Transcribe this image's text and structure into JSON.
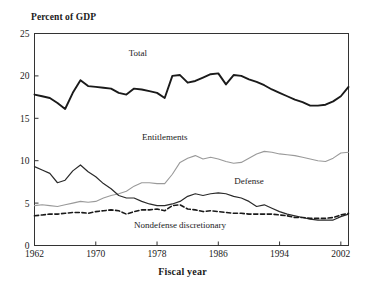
{
  "chart_data": {
    "type": "line",
    "title": "",
    "ylabel": "Percent of GDP",
    "xlabel": "Fiscal year",
    "ylim": [
      0,
      25
    ],
    "xlim": [
      1962,
      2003
    ],
    "yticks": [
      0,
      5,
      10,
      15,
      20,
      25
    ],
    "ytick_labels": [
      "0",
      "5",
      "10",
      "15",
      "20",
      "25"
    ],
    "xticks": [
      1962,
      1970,
      1978,
      1986,
      1994,
      2002
    ],
    "xtick_labels": [
      "1962",
      "1970",
      "1978",
      "1986",
      "1994",
      "2002"
    ],
    "grid": false,
    "legend_position": "inline-annotations",
    "x": [
      1962,
      1963,
      1964,
      1965,
      1966,
      1967,
      1968,
      1969,
      1970,
      1971,
      1972,
      1973,
      1974,
      1975,
      1976,
      1977,
      1978,
      1979,
      1980,
      1981,
      1982,
      1983,
      1984,
      1985,
      1986,
      1987,
      1988,
      1989,
      1990,
      1991,
      1992,
      1993,
      1994,
      1995,
      1996,
      1997,
      1998,
      1999,
      2000,
      2001,
      2002,
      2003
    ],
    "series": [
      {
        "name": "Total",
        "color": "#1a1a1a",
        "style": "solid-thick",
        "label_x": 1975.5,
        "label_y": 22.3,
        "values": [
          17.8,
          17.6,
          17.4,
          16.8,
          16.1,
          18.0,
          19.5,
          18.8,
          18.7,
          18.6,
          18.5,
          18.0,
          17.8,
          18.5,
          18.4,
          18.2,
          18.0,
          17.4,
          20.0,
          20.1,
          19.2,
          19.4,
          19.8,
          20.2,
          20.3,
          19.0,
          20.1,
          20.0,
          19.6,
          19.3,
          18.9,
          18.4,
          18.0,
          17.6,
          17.2,
          16.9,
          16.5,
          16.5,
          16.6,
          17.0,
          17.6,
          18.7
        ]
      },
      {
        "name": "Entitlements",
        "color": "#9a9a9a",
        "style": "solid-thin",
        "label_x": 1979.0,
        "label_y": 12.4,
        "values": [
          4.7,
          4.8,
          4.7,
          4.6,
          4.8,
          5.0,
          5.2,
          5.1,
          5.2,
          5.6,
          5.9,
          6.1,
          6.4,
          7.0,
          7.4,
          7.4,
          7.3,
          7.3,
          8.4,
          9.8,
          10.3,
          10.6,
          10.2,
          10.4,
          10.2,
          9.9,
          9.7,
          9.8,
          10.3,
          10.8,
          11.1,
          11.0,
          10.8,
          10.7,
          10.6,
          10.4,
          10.2,
          10.0,
          9.9,
          10.3,
          10.9,
          11.0
        ]
      },
      {
        "name": "Defense",
        "color": "#2a2a2a",
        "style": "solid-med",
        "label_x": 1990.0,
        "label_y": 7.2,
        "values": [
          9.3,
          8.9,
          8.5,
          7.4,
          7.7,
          8.8,
          9.5,
          8.7,
          8.1,
          7.3,
          6.7,
          5.9,
          5.6,
          5.6,
          5.2,
          4.9,
          4.7,
          4.7,
          4.9,
          5.2,
          5.8,
          6.1,
          5.9,
          6.1,
          6.2,
          6.1,
          5.8,
          5.6,
          5.2,
          4.6,
          4.8,
          4.4,
          4.0,
          3.7,
          3.5,
          3.3,
          3.1,
          3.0,
          3.0,
          3.0,
          3.4,
          3.7
        ]
      },
      {
        "name": "Nondefense discretionary",
        "color": "#1a1a1a",
        "style": "dashed",
        "label_x": 1981.0,
        "label_y": 2.1,
        "values": [
          3.5,
          3.6,
          3.7,
          3.7,
          3.8,
          3.9,
          3.9,
          3.8,
          4.0,
          4.1,
          4.2,
          4.1,
          3.7,
          4.0,
          4.2,
          4.2,
          4.3,
          4.1,
          4.7,
          4.8,
          4.3,
          4.2,
          4.0,
          4.1,
          4.0,
          3.9,
          3.8,
          3.8,
          3.7,
          3.7,
          3.7,
          3.7,
          3.6,
          3.5,
          3.3,
          3.3,
          3.2,
          3.2,
          3.2,
          3.3,
          3.6,
          3.8
        ]
      }
    ]
  }
}
